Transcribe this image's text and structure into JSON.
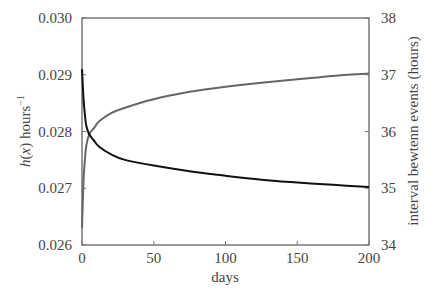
{
  "chart_data": {
    "type": "line",
    "title": "",
    "xlabel": "days",
    "ylabel_left": "h(x) hours⁻¹",
    "ylabel_left_parts": {
      "h": "h",
      "open": "(",
      "x": "x",
      "close": ")",
      "unit": " hours",
      "exp": "−1"
    },
    "ylabel_right": "interval bewtenn events (hours)",
    "xlim": [
      0,
      200
    ],
    "ylim_left": [
      0.026,
      0.03
    ],
    "ylim_right": [
      34,
      38
    ],
    "x_ticks": [
      "0",
      "50",
      "100",
      "150",
      "200"
    ],
    "y_left_ticks": [
      "0.026",
      "0.027",
      "0.028",
      "0.029",
      "0.030"
    ],
    "y_right_ticks": [
      "34",
      "35",
      "36",
      "37",
      "38"
    ],
    "grid": false,
    "legend": null,
    "series": [
      {
        "name": "h(x)",
        "axis": "left",
        "color": "#111111",
        "x": [
          0,
          1,
          2,
          3,
          5,
          8,
          12,
          20,
          30,
          50,
          75,
          100,
          125,
          150,
          175,
          200
        ],
        "values": [
          0.0291,
          0.0286,
          0.0283,
          0.0281,
          0.02795,
          0.02785,
          0.02773,
          0.0276,
          0.0275,
          0.0274,
          0.0273,
          0.02722,
          0.02715,
          0.0271,
          0.02706,
          0.02702
        ]
      },
      {
        "name": "interval between events",
        "axis": "right",
        "color": "#666666",
        "x": [
          0,
          1,
          2,
          3,
          5,
          8,
          12,
          20,
          30,
          50,
          75,
          100,
          125,
          150,
          175,
          200
        ],
        "values": [
          34.3,
          35.1,
          35.5,
          35.75,
          35.95,
          36.05,
          36.18,
          36.32,
          36.42,
          36.57,
          36.7,
          36.79,
          36.86,
          36.92,
          36.98,
          37.02
        ]
      }
    ]
  }
}
